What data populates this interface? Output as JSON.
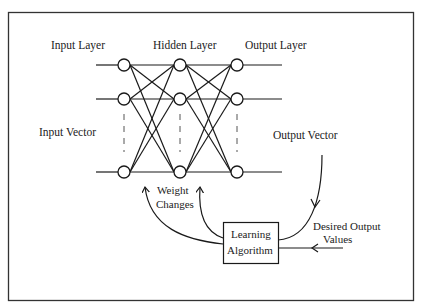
{
  "diagram": {
    "labels": {
      "input_layer": "Input Layer",
      "hidden_layer": "Hidden Layer",
      "output_layer": "Output Layer",
      "input_vector": "Input Vector",
      "output_vector": "Output Vector",
      "weight_changes_line1": "Weight",
      "weight_changes_line2": "Changes",
      "learning_line1": "Learning",
      "learning_line2": "Algorithm",
      "desired_line1": "Desired Output",
      "desired_line2": "Values"
    },
    "layers": [
      {
        "name": "input",
        "x": 124,
        "nodes_y": [
          65,
          99,
          172
        ]
      },
      {
        "name": "hidden",
        "x": 180,
        "nodes_y": [
          65,
          99,
          172
        ]
      },
      {
        "name": "output",
        "x": 237,
        "nodes_y": [
          65,
          99,
          172
        ]
      }
    ],
    "colors": {
      "stroke": "#1a1a1a",
      "background": "#ffffff",
      "border": "#333333"
    }
  }
}
